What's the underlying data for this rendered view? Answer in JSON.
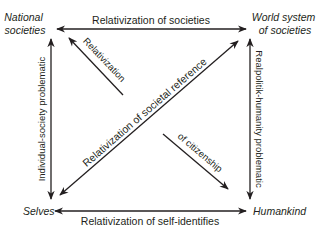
{
  "nodes": {
    "national_societies": [
      "National",
      "societies"
    ],
    "world_system": [
      "World system",
      "of societies"
    ],
    "selves": "Selves",
    "humankind": "Humankind"
  },
  "edges": {
    "top": "Relativization of societies",
    "bottom": "Relativization of self-identifies",
    "left": "Individual-society problematic",
    "right": "Realpolitik-humanity problematic",
    "diagonal_main": "Relativization of societal reference",
    "diagonal_upper": "Relativization",
    "diagonal_lower": "of citizenship"
  },
  "colors": {
    "ink": "#231f20",
    "background": "#ffffff"
  }
}
